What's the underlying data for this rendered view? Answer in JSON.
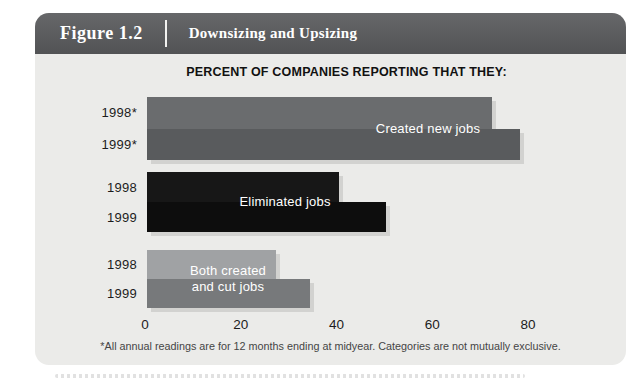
{
  "figure": {
    "label": "Figure 1.2",
    "title": "Downsizing and Upsizing"
  },
  "chart_data": {
    "type": "bar",
    "orientation": "horizontal",
    "title": "PERCENT OF COMPANIES REPORTING THAT THEY:",
    "xlim": [
      0,
      80
    ],
    "x_ticks": [
      "0",
      "20",
      "40",
      "60",
      "80"
    ],
    "grid": false,
    "legend": "labels-on-bars",
    "groups": [
      {
        "label": "Created new jobs",
        "label_lines": [
          "Created new jobs"
        ],
        "bars": [
          {
            "year": "1998*",
            "value": 72,
            "color": "#6a6c6e"
          },
          {
            "year": "1999*",
            "value": 78,
            "color": "#595b5d"
          }
        ]
      },
      {
        "label": "Eliminated jobs",
        "label_lines": [
          "Eliminated jobs"
        ],
        "bars": [
          {
            "year": "1998",
            "value": 40,
            "color": "#171717"
          },
          {
            "year": "1999",
            "value": 50,
            "color": "#0d0d0d"
          }
        ]
      },
      {
        "label": "Both created and cut jobs",
        "label_lines": [
          "Both created",
          "and cut jobs"
        ],
        "bars": [
          {
            "year": "1998",
            "value": 27,
            "color": "#a0a2a4"
          },
          {
            "year": "1999",
            "value": 34,
            "color": "#77797b"
          }
        ]
      }
    ]
  },
  "footnote": "*All annual readings are for 12 months ending at midyear. Categories are not mutually exclusive."
}
